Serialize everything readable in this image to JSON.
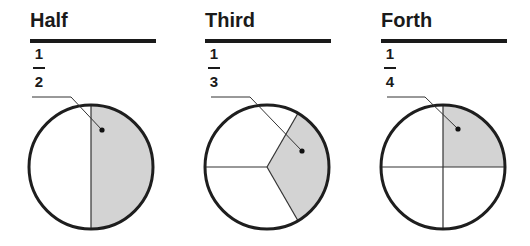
{
  "colors": {
    "ink": "#1a1a1a",
    "shade": "#d3d3d3",
    "outline": "#1e1e1e",
    "background": "#ffffff"
  },
  "panels": [
    {
      "title": "Half",
      "fraction": {
        "numerator": "1",
        "denominator": "2"
      },
      "divisions": 2,
      "shaded_parts": 1
    },
    {
      "title": "Third",
      "fraction": {
        "numerator": "1",
        "denominator": "3"
      },
      "divisions": 3,
      "shaded_parts": 1
    },
    {
      "title": "Forth",
      "fraction": {
        "numerator": "1",
        "denominator": "4"
      },
      "divisions": 4,
      "shaded_parts": 1
    }
  ]
}
